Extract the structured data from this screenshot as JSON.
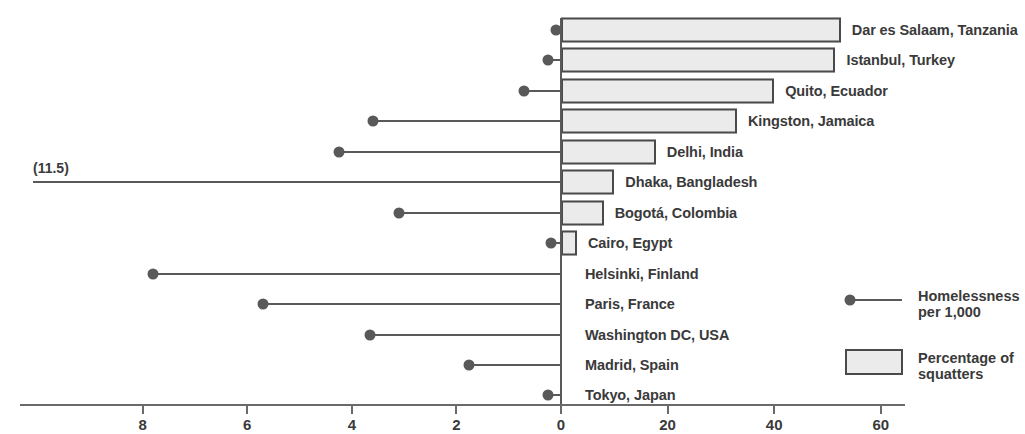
{
  "chart_data": {
    "type": "bar",
    "title": "",
    "subtitle": "",
    "xlabel": "",
    "ylabel": "",
    "grid": false,
    "legend_position": "right",
    "axis": {
      "tick_labels": [
        "8",
        "6",
        "4",
        "2",
        "0",
        "20",
        "40",
        "60"
      ],
      "homeless_axis_range": [
        9.5,
        0
      ],
      "squatter_axis_range": [
        0,
        65
      ],
      "note": "Diverging axis: left side is homelessness per 1,000 (descending 8 to 0), right side is percentage of squatters (0 to 60)"
    },
    "categories": [
      "Dar es Salaam, Tanzania",
      "Istanbul, Turkey",
      "Quito, Ecuador",
      "Kingston, Jamaica",
      "Delhi, India",
      "Dhaka, Bangladesh",
      "Bogotá, Colombia",
      "Cairo, Egypt",
      "Helsinki, Finland",
      "Paris, France",
      "Washington DC, USA",
      "Madrid, Spain",
      "Tokyo, Japan"
    ],
    "series": [
      {
        "name": "Percentage of squatters",
        "unit": "%",
        "values": [
          52.5,
          51.5,
          40.0,
          33.0,
          17.8,
          10.0,
          8.0,
          3.0,
          null,
          null,
          null,
          null,
          null
        ]
      },
      {
        "name": "Homelessness per 1,000",
        "unit": "per 1,000",
        "values": [
          0.1,
          0.25,
          0.7,
          3.6,
          4.25,
          11.5,
          3.1,
          0.2,
          7.8,
          5.7,
          3.65,
          1.75,
          0.25
        ]
      }
    ],
    "annotations": [
      {
        "label": "(11.5)",
        "category": "Dhaka, Bangladesh",
        "series": "Homelessness per 1,000",
        "note": "value exceeds axis, line runs off scale to the left"
      }
    ]
  },
  "legend": {
    "items": [
      {
        "label": "Homelessness\nper 1,000",
        "marker": "lollipop-marker"
      },
      {
        "label": "Percentage of\nsquatters",
        "marker": "rect-swatch"
      }
    ]
  },
  "colors": {
    "bar_fill": "#ebebeb",
    "bar_border": "#4a4a4a",
    "marker": "#595959",
    "axis": "#6a6a6a",
    "text": "#3a3a3a",
    "background": "#ffffff"
  }
}
